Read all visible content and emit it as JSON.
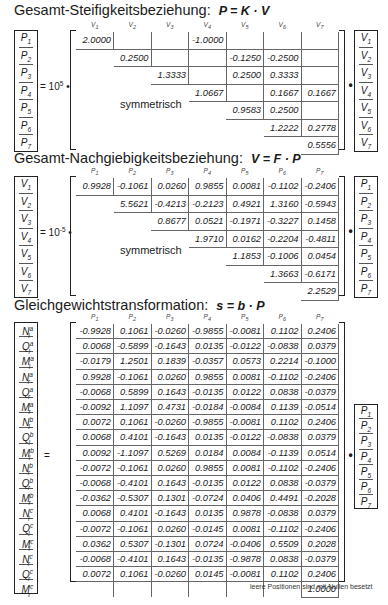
{
  "sections": [
    {
      "title": "Gesamt-Steifigkeitsbeziehung:",
      "equation": "P = K · V",
      "left_vector": [
        "P1",
        "P2",
        "P3",
        "P4",
        "P5",
        "P6",
        "P7"
      ],
      "factor": "= 10",
      "exponent": "5",
      "column_headers": [
        "V1",
        "V2",
        "V3",
        "V4",
        "V5",
        "V6",
        "V7"
      ],
      "symmetric_label": "symmetrisch",
      "matrix": [
        [
          "2.0000",
          "",
          "",
          "-1.0000",
          "",
          "",
          ""
        ],
        [
          "",
          "0.2500",
          "",
          "",
          "-0.1250",
          "-0.2500",
          ""
        ],
        [
          "",
          "",
          "1.3333",
          "",
          "0.2500",
          "0.3333",
          ""
        ],
        [
          "",
          "",
          "",
          "1.0667",
          "",
          "0.1667",
          "0.1667"
        ],
        [
          "",
          "",
          "",
          "",
          "0.9583",
          "0.2500",
          ""
        ],
        [
          "",
          "",
          "",
          "",
          "",
          "1.2222",
          "0.2778"
        ],
        [
          "",
          "",
          "",
          "",
          "",
          "",
          "0.5556"
        ]
      ],
      "right_vector": [
        "V1",
        "V2",
        "V3",
        "V4",
        "V5",
        "V6",
        "V7"
      ]
    },
    {
      "title": "Gesamt-Nachgiebigkeitsbeziehung:",
      "equation": "V = F · P",
      "left_vector": [
        "V1",
        "V2",
        "V3",
        "V4",
        "V5",
        "V6",
        "V7"
      ],
      "factor": "= 10",
      "exponent": "-5",
      "column_headers": [
        "P1",
        "P2",
        "P3",
        "P4",
        "P5",
        "P6",
        "P7"
      ],
      "symmetric_label": "symmetrisch",
      "matrix": [
        [
          "0.9928",
          "-0.1061",
          "0.0260",
          "0.9855",
          "0.0081",
          "-0.1102",
          "-0.2406"
        ],
        [
          "",
          "5.5621",
          "-0.4213",
          "-0.2123",
          "0.4921",
          "1.3160",
          "-0.5943"
        ],
        [
          "",
          "",
          "0.8677",
          "0.0521",
          "-0.1971",
          "-0.3227",
          "0.1458"
        ],
        [
          "",
          "",
          "",
          "1.9710",
          "0.0162",
          "-0.2204",
          "-0.4811"
        ],
        [
          "",
          "",
          "",
          "",
          "1.1853",
          "-0.1006",
          "0.0454"
        ],
        [
          "",
          "",
          "",
          "",
          "",
          "1.3663",
          "-0.6171"
        ],
        [
          "",
          "",
          "",
          "",
          "",
          "",
          "2.2529"
        ]
      ],
      "right_vector": [
        "P1",
        "P2",
        "P3",
        "P4",
        "P5",
        "P6",
        "P7"
      ]
    },
    {
      "title": "Gleichgewichtstransformation:",
      "equation": "s = b · P",
      "left_vector": [
        "N_l^a",
        "Q_l^a",
        "M_l^a",
        "N_r^a",
        "Q_r^a",
        "M_r^a",
        "N_l^b",
        "Q_l^b",
        "M_l^b",
        "N_r^b",
        "Q_r^b",
        "M_r^b",
        "N_l^c",
        "Q_l^c",
        "M_l^c",
        "N_r^c",
        "Q_r^c",
        "M_r^c"
      ],
      "factor": "=",
      "column_headers": [
        "P1",
        "P2",
        "P3",
        "P4",
        "P5",
        "P6",
        "P7"
      ],
      "matrix": [
        [
          "-0.9928",
          "0.1061",
          "-0.0260",
          "-0.9855",
          "-0.0081",
          "0.1102",
          "0.2406"
        ],
        [
          "0.0068",
          "-0.5899",
          "-0.1643",
          "0.0135",
          "-0.0122",
          "-0.0838",
          "0.0379"
        ],
        [
          "-0.0179",
          "1.2501",
          "0.1839",
          "-0.0357",
          "0.0573",
          "0.2214",
          "-0.1000"
        ],
        [
          "0.9928",
          "-0.1061",
          "0.0260",
          "0.9855",
          "0.0081",
          "-0.1102",
          "-0.2406"
        ],
        [
          "-0.0068",
          "0.5899",
          "0.1643",
          "-0.0135",
          "0.0122",
          "0.0838",
          "-0.0379"
        ],
        [
          "-0.0092",
          "1.1097",
          "0.4731",
          "-0.0184",
          "-0.0084",
          "0.1139",
          "-0.0514"
        ],
        [
          "0.0072",
          "0.1061",
          "-0.0260",
          "-0.9855",
          "-0.0081",
          "0.1102",
          "0.2406"
        ],
        [
          "0.0068",
          "0.4101",
          "-0.1643",
          "0.0135",
          "-0.0122",
          "-0.0838",
          "0.0379"
        ],
        [
          "0.0092",
          "-1.1097",
          "0.5269",
          "0.0184",
          "0.0084",
          "-0.1139",
          "0.0514"
        ],
        [
          "-0.0072",
          "-0.1061",
          "0.0260",
          "0.9855",
          "0.0081",
          "-0.1102",
          "-0.2406"
        ],
        [
          "-0.0068",
          "-0.4101",
          "0.1643",
          "-0.0135",
          "0.0122",
          "0.0838",
          "-0.0379"
        ],
        [
          "-0.0362",
          "-0.5307",
          "0.1301",
          "-0.0724",
          "0.0406",
          "0.4491",
          "-0.2028"
        ],
        [
          "0.0068",
          "0.4101",
          "-0.1643",
          "0.0135",
          "0.9878",
          "-0.0838",
          "0.0379"
        ],
        [
          "-0.0072",
          "-0.1061",
          "0.0260",
          "-0.0145",
          "0.0081",
          "-0.1102",
          "-0.2406"
        ],
        [
          "0.0362",
          "0.5307",
          "-0.1301",
          "0.0724",
          "-0.0406",
          "0.5509",
          "0.2028"
        ],
        [
          "-0.0068",
          "-0.4101",
          "0.1643",
          "-0.0135",
          "-0.9878",
          "0.0838",
          "-0.0379"
        ],
        [
          "0.0072",
          "0.1061",
          "-0.0260",
          "0.0145",
          "-0.0081",
          "0.1102",
          "0.2406"
        ],
        [
          "",
          "",
          "",
          "",
          "",
          "",
          "1.0000"
        ]
      ],
      "right_vector": [
        "P1",
        "P2",
        "P3",
        "P4",
        "P5",
        "P6",
        "P7"
      ],
      "footnote": "leere Positionen sind mit Nullen besetzt"
    }
  ]
}
